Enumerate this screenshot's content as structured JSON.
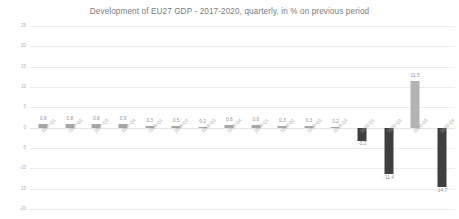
{
  "chart_data": {
    "type": "bar",
    "title": "Development of EU27 GDP - 2017-2020, quarterly, in % on previous period",
    "xlabel": "",
    "ylabel": "",
    "ylim": [
      -20,
      25
    ],
    "ytick_step": 5,
    "grid": true,
    "legend": "none",
    "categories": [
      "2017-Q1",
      "2017-Q2",
      "2017-Q3",
      "2017-Q4",
      "2018-Q1",
      "2018-Q2",
      "2018-Q3",
      "2018-Q4",
      "2019-Q1",
      "2019-Q2",
      "2019-Q3",
      "2019-Q4",
      "2020-Q1",
      "2020-Q2",
      "2020-Q3",
      "2020-Q4"
    ],
    "values": [
      0.8,
      0.8,
      0.8,
      0.9,
      0.3,
      0.5,
      0.2,
      0.6,
      0.6,
      0.3,
      0.3,
      0.2,
      -3.2,
      -11.4,
      11.5,
      -14.7
    ],
    "value_labels": [
      "0.8",
      "0.8",
      "0.8",
      "0.9",
      "0.3",
      "0.5",
      "0.2",
      "0.6",
      "0.6",
      "0.3",
      "0.3",
      "0.2",
      "-3.2",
      "-11.4",
      "11.5",
      "-14.7"
    ],
    "ytick_labels": [
      "25",
      "20",
      "15",
      "10",
      "5",
      "0",
      "-5",
      "-10",
      "-15",
      "-20"
    ],
    "ytick_values": [
      25,
      20,
      15,
      10,
      5,
      0,
      -5,
      -10,
      -15,
      -20
    ],
    "colors": {
      "positive_bar": "#a6a6a6",
      "negative_bar": "#3f3f3f",
      "rebound_bar": "#b3b3b3",
      "gridline": "#ededed",
      "title_text": "#7b7b7b",
      "label_text": "#8f8f8f",
      "tick_text": "#b0b0b0",
      "background": "#ffffff"
    }
  }
}
